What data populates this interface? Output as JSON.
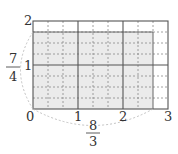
{
  "diagram": {
    "type": "area-model-grid",
    "x_axis": {
      "ticks": [
        "0",
        "1",
        "2",
        "3"
      ],
      "fraction_label": {
        "numerator": "8",
        "denominator": "3"
      },
      "subdivisions_per_unit": 3
    },
    "y_axis": {
      "ticks": [
        "1",
        "2"
      ],
      "fraction_label": {
        "numerator": "7",
        "denominator": "4"
      },
      "subdivisions_per_unit": 4
    },
    "shaded_region": {
      "width": "8/3",
      "height": "7/4",
      "color": "#ebebeb"
    },
    "grid_color": "#555555",
    "dashed_color": "#888888",
    "brace_color": "#bbbbbb"
  }
}
